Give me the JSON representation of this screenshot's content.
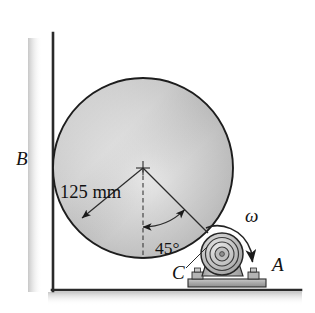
{
  "figure": {
    "background_color": "#ffffff",
    "line_color": "#1a1a1a",
    "labels": {
      "wall_point": "B",
      "caster_contact": "C",
      "floor_point": "A",
      "angular_velocity": "ω",
      "radius_dimension": "125 mm",
      "angle_dimension": "45°"
    },
    "geometry": {
      "cylinder_center_x": 143,
      "cylinder_center_y": 168,
      "cylinder_radius_px": 90,
      "cylinder_radius_value": "125 mm",
      "contact_angle_from_vertical": "45°",
      "wall_x": 53,
      "floor_y": 290
    },
    "colors": {
      "cylinder_light": "#e2e2e2",
      "cylinder_mid": "#c3c3c3",
      "cylinder_dark": "#a9a9a9",
      "outline": "#1a1a1a",
      "metal_light": "#d6d6d6",
      "metal_mid": "#b0b0b0",
      "metal_dark": "#8a8a8a",
      "shadow": "#d9d9d9"
    }
  }
}
